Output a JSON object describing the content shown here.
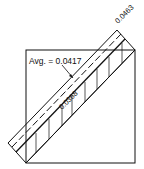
{
  "diagram": {
    "labels": {
      "avg": "Avg. = 0.0417",
      "upper": "0.0463",
      "lower": "0.0368"
    },
    "colors": {
      "stroke": "#111111",
      "background": "#ffffff"
    }
  }
}
